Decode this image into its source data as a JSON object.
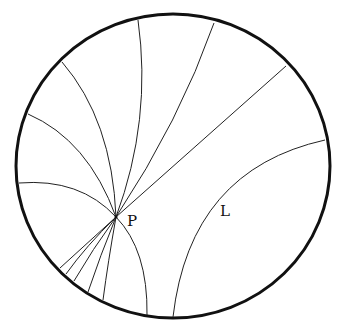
{
  "diagram": {
    "boundary": {
      "cx": 173,
      "cy": 166,
      "rx": 157,
      "ry": 152
    },
    "point": {
      "name": "P",
      "label": "P",
      "x": 116,
      "y": 217
    },
    "line": {
      "name": "L",
      "label": "L"
    },
    "labels": {
      "P": "P",
      "L": "L"
    }
  }
}
